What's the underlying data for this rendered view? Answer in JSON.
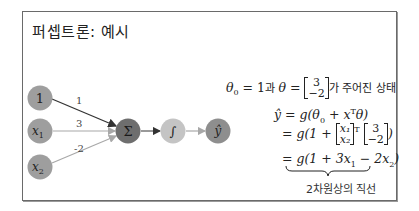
{
  "title": "퍼셉트론: 예시",
  "nodes": {
    "bias": "1",
    "x1": "x",
    "x1_sub": "1",
    "x2": "x",
    "x2_sub": "2",
    "sum": "Σ",
    "activation": "∫",
    "output": "ŷ"
  },
  "weights": {
    "w0": "1",
    "w1": "3",
    "w2": "-2"
  },
  "colors": {
    "input_node": "#9e9e9e",
    "sum_node": "#6e6e6e",
    "activation_node": "#c4c4c4",
    "output_node": "#8e8e8e",
    "edge_dark": "#333333",
    "edge_light": "#a8a8a8"
  },
  "equations": {
    "line1": {
      "theta0": "θ",
      "theta0_sub": "0",
      "eq1": " = 1",
      "conj": "과 ",
      "theta": "θ = ",
      "vec_top": "3",
      "vec_bottom": "−2",
      "suffix": "가 주어진 상태"
    },
    "line2": {
      "lhs": "ŷ = g(θ",
      "sub": "0",
      "rest": " + x",
      "sup": "T",
      "end": "θ)"
    },
    "line3": {
      "pre": "= g(1 + ",
      "vec_top": "x₁",
      "vec_bottom": "x₂",
      "sup": "T",
      "w_top": "3",
      "w_bottom": "−2",
      "end": ")"
    },
    "line4": {
      "text": "= g(1 + 3x",
      "s1": "1",
      "mid": " − 2x",
      "s2": "2",
      "end": ")"
    }
  },
  "caption": "2차원상의 직선"
}
